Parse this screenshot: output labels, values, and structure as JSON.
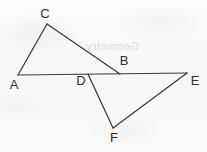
{
  "figure": {
    "background_color": "#f8f8f7",
    "stroke_color": "#3b3b3b",
    "label_color": "#2f2f2f",
    "width": 207,
    "height": 152,
    "ghost_artifact_text": "Geometry",
    "points": [
      {
        "id": "A",
        "label": "A",
        "x": 18,
        "y": 75,
        "label_x": 14,
        "label_y": 86
      },
      {
        "id": "B",
        "label": "B",
        "x": 120,
        "y": 74,
        "label_x": 124,
        "label_y": 62
      },
      {
        "id": "C",
        "label": "C",
        "x": 47,
        "y": 24,
        "label_x": 45,
        "label_y": 15
      },
      {
        "id": "D",
        "label": "D",
        "x": 88,
        "y": 74,
        "label_x": 81,
        "label_y": 82
      },
      {
        "id": "E",
        "label": "E",
        "x": 187,
        "y": 73,
        "label_x": 195,
        "label_y": 82
      },
      {
        "id": "F",
        "label": "F",
        "x": 113,
        "y": 128,
        "label_x": 114,
        "label_y": 139
      }
    ],
    "segments": [
      {
        "id": "AC",
        "from": "A",
        "to": "C",
        "x1": 18,
        "y1": 75,
        "x2": 47,
        "y2": 24
      },
      {
        "id": "CB",
        "from": "C",
        "to": "B",
        "x1": 47,
        "y1": 24,
        "x2": 120,
        "y2": 74
      },
      {
        "id": "AE",
        "from": "A",
        "to": "E",
        "x1": 18,
        "y1": 75,
        "x2": 187,
        "y2": 73
      },
      {
        "id": "DF",
        "from": "D",
        "to": "F",
        "x1": 88,
        "y1": 74,
        "x2": 113,
        "y2": 128
      },
      {
        "id": "FE",
        "from": "F",
        "to": "E",
        "x1": 113,
        "y1": 128,
        "x2": 187,
        "y2": 73
      }
    ]
  }
}
